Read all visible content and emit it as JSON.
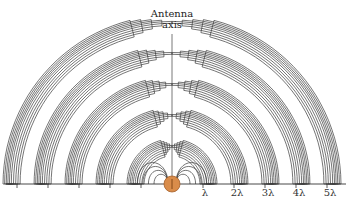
{
  "diagram": {
    "type": "dipole-antenna-radiation-field-lines",
    "antenna_label_line1": "Antenna",
    "antenna_label_line2": "axis",
    "axis_ticks": [
      "λ",
      "2λ",
      "3λ",
      "4λ",
      "5λ"
    ],
    "colors": {
      "lines": "#3a3a3a",
      "antenna_fill": "#d98c4a",
      "antenna_stroke": "#a5602a",
      "background": "#ffffff"
    }
  }
}
